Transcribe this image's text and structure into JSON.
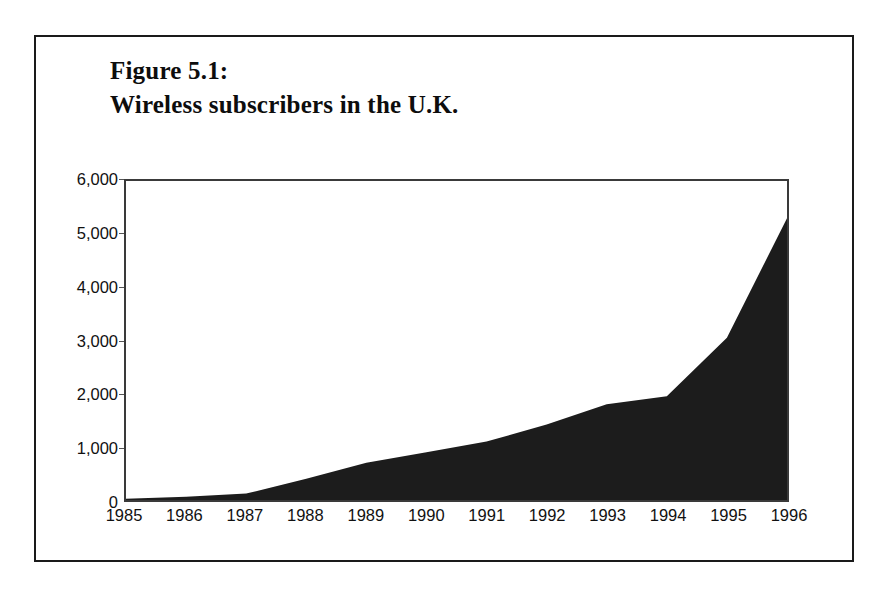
{
  "figure": {
    "title_line1": "Figure 5.1:",
    "title_line2": "Wireless subscribers in the U.K."
  },
  "chart_data": {
    "type": "area",
    "title": "Figure 5.1: Wireless subscribers in the U.K.",
    "xlabel": "",
    "ylabel": "",
    "categories": [
      "1985",
      "1986",
      "1987",
      "1988",
      "1989",
      "1990",
      "1991",
      "1992",
      "1993",
      "1994",
      "1995",
      "1996"
    ],
    "values": [
      25,
      60,
      120,
      400,
      700,
      900,
      1100,
      1420,
      1800,
      1950,
      3050,
      5300
    ],
    "series": [
      {
        "name": "Wireless subscribers in the U.K.",
        "values": [
          25,
          60,
          120,
          400,
          700,
          900,
          1100,
          1420,
          1800,
          1950,
          3050,
          5300
        ]
      }
    ],
    "ylim": [
      0,
      6000
    ],
    "ytick_labels": [
      "0",
      "1,000",
      "2,000",
      "3,000",
      "4,000",
      "5,000",
      "6,000"
    ],
    "ytick_values": [
      0,
      1000,
      2000,
      3000,
      4000,
      5000,
      6000
    ],
    "xtick_labels": [
      "1985",
      "1986",
      "1987",
      "1988",
      "1989",
      "1990",
      "1991",
      "1992",
      "1993",
      "1994",
      "1995",
      "1996"
    ],
    "grid": false,
    "legend": "none",
    "fill_color": "#1c1c1c",
    "axis_color": "#3a3a3a",
    "background_color": "#ffffff"
  }
}
